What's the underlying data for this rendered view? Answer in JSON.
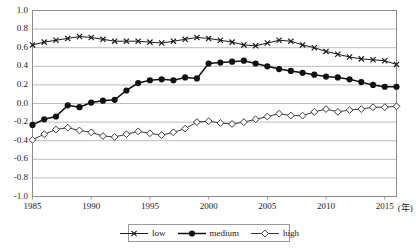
{
  "chart_data": {
    "type": "line",
    "title": "",
    "xlabel": "(年)",
    "ylabel": "",
    "xlim": [
      1985,
      2016
    ],
    "ylim": [
      -1.0,
      1.0
    ],
    "grid": true,
    "legend_position": "bottom",
    "x": [
      1985,
      1986,
      1987,
      1988,
      1989,
      1990,
      1991,
      1992,
      1993,
      1994,
      1995,
      1996,
      1997,
      1998,
      1999,
      2000,
      2001,
      2002,
      2003,
      2004,
      2005,
      2006,
      2007,
      2008,
      2009,
      2010,
      2011,
      2012,
      2013,
      2014,
      2015,
      2016
    ],
    "xtick_values": [
      1985,
      1990,
      1995,
      2000,
      2005,
      2010,
      2015
    ],
    "xtick_labels": [
      "1985",
      "1990",
      "1995",
      "2000",
      "2005",
      "2010",
      "2015"
    ],
    "ytick_values": [
      -1.0,
      -0.8,
      -0.6,
      -0.4,
      -0.2,
      0.0,
      0.2,
      0.4,
      0.6,
      0.8,
      1.0
    ],
    "ytick_labels": [
      "-1.0",
      "-0.8",
      "-0.6",
      "-0.4",
      "-0.2",
      "0.0",
      "0.2",
      "0.4",
      "0.6",
      "0.8",
      "1.0"
    ],
    "series": [
      {
        "name": "low",
        "marker": "x",
        "color": "#1a1a1a",
        "values": [
          0.63,
          0.66,
          0.68,
          0.7,
          0.72,
          0.71,
          0.69,
          0.67,
          0.67,
          0.67,
          0.66,
          0.65,
          0.67,
          0.69,
          0.71,
          0.7,
          0.68,
          0.66,
          0.63,
          0.62,
          0.65,
          0.68,
          0.67,
          0.63,
          0.6,
          0.56,
          0.53,
          0.5,
          0.48,
          0.47,
          0.46,
          0.42
        ]
      },
      {
        "name": "medium",
        "marker": "circle-filled",
        "color": "#111111",
        "values": [
          -0.23,
          -0.17,
          -0.14,
          -0.02,
          -0.04,
          0.01,
          0.03,
          0.04,
          0.14,
          0.22,
          0.25,
          0.26,
          0.25,
          0.28,
          0.27,
          0.43,
          0.44,
          0.45,
          0.46,
          0.43,
          0.4,
          0.37,
          0.35,
          0.33,
          0.31,
          0.29,
          0.28,
          0.26,
          0.23,
          0.2,
          0.18,
          0.18
        ]
      },
      {
        "name": "high",
        "marker": "diamond-open",
        "color": "#3a3a3a",
        "values": [
          -0.39,
          -0.33,
          -0.28,
          -0.26,
          -0.29,
          -0.31,
          -0.35,
          -0.36,
          -0.33,
          -0.3,
          -0.32,
          -0.34,
          -0.31,
          -0.27,
          -0.2,
          -0.19,
          -0.21,
          -0.22,
          -0.2,
          -0.17,
          -0.14,
          -0.11,
          -0.13,
          -0.13,
          -0.09,
          -0.06,
          -0.09,
          -0.07,
          -0.06,
          -0.04,
          -0.04,
          -0.03
        ]
      }
    ]
  },
  "legend": {
    "items": [
      {
        "label": "low",
        "marker": "x"
      },
      {
        "label": "medium",
        "marker": "circle-filled"
      },
      {
        "label": "high",
        "marker": "diamond-open"
      }
    ]
  },
  "axis": {
    "x_unit_label": "(年)"
  },
  "style": {
    "grid_color": "#aaaaaa",
    "frame_color": "#8c8c8c",
    "text_color": "#1a1a1a"
  }
}
